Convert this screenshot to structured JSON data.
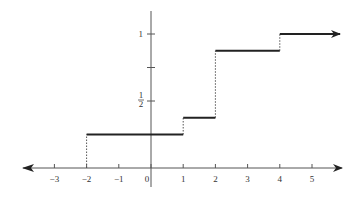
{
  "chart_data": {
    "type": "line",
    "subtype": "step",
    "title": "",
    "xlabel": "",
    "ylabel": "",
    "xlim": [
      -3.9,
      5.9
    ],
    "ylim": [
      -0.15,
      1.2
    ],
    "grid": false,
    "legend": null,
    "x_ticks": [
      -3,
      -2,
      -1,
      0,
      1,
      2,
      3,
      4,
      5
    ],
    "x_tick_labels": [
      "−3",
      "−2",
      "−1",
      "0",
      "1",
      "2",
      "3",
      "4",
      "5"
    ],
    "y_ticks": [
      0.5,
      0.75,
      1
    ],
    "y_tick_labels": [
      "1/2",
      "",
      "1"
    ],
    "steps": [
      {
        "x_start": -2,
        "x_end": 1,
        "y": 0.25
      },
      {
        "x_start": 1,
        "x_end": 2,
        "y": 0.375
      },
      {
        "x_start": 2,
        "x_end": 4,
        "y": 0.875
      },
      {
        "x_start": 4,
        "x_end": 5.9,
        "y": 1.0,
        "arrow": true
      }
    ],
    "dashed_jumps": [
      {
        "x": -2,
        "y_from": 0,
        "y_to": 0.25
      },
      {
        "x": 1,
        "y_from": 0.25,
        "y_to": 0.375
      },
      {
        "x": 2,
        "y_from": 0.375,
        "y_to": 0.875
      },
      {
        "x": 4,
        "y_from": 0.875,
        "y_to": 1.0
      }
    ],
    "x_axis_arrows": "both",
    "colors": {
      "axis": "#555555",
      "step": "#222222",
      "dashed": "#555555"
    }
  }
}
